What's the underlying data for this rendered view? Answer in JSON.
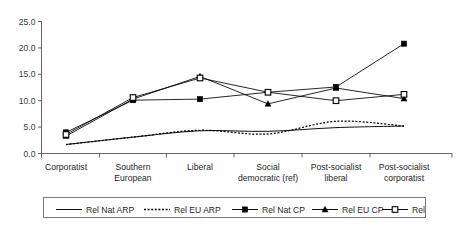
{
  "chart_data": {
    "type": "line",
    "title": "",
    "xlabel": "",
    "ylabel": "",
    "ylim": [
      0,
      25
    ],
    "ytick_values": [
      0,
      5,
      10,
      15,
      20,
      25
    ],
    "ytick_labels": [
      "0.0",
      "5.0",
      "10.0",
      "15.0",
      "20.0",
      "25.0"
    ],
    "grid": false,
    "legend_position": "bottom",
    "categories": [
      "Corporatist",
      "Southern European",
      "Liberal",
      "Social democratic (ref)",
      "Post-socialist liberal",
      "Post-socialist corporatist"
    ],
    "category_label_lines": [
      [
        "Corporatist"
      ],
      [
        "Southern",
        "European"
      ],
      [
        "Liberal"
      ],
      [
        "Social",
        "democratic (ref)"
      ],
      [
        "Post-socialist",
        "liberal"
      ],
      [
        "Post-socialist",
        "corporatist"
      ]
    ],
    "series": [
      {
        "name": "Rel Nat ARP",
        "style": "solid-line",
        "marker": "none",
        "smooth": true,
        "values": [
          1.7,
          3.1,
          4.3,
          4.2,
          4.9,
          5.2
        ]
      },
      {
        "name": "Rel EU ARP",
        "style": "dotted-line",
        "marker": "none",
        "smooth": true,
        "values": [
          1.7,
          3.1,
          4.4,
          3.7,
          6.1,
          5.2
        ]
      },
      {
        "name": "Rel Nat CP",
        "style": "solid-line",
        "marker": "filled-square",
        "smooth": false,
        "values": [
          4.0,
          10.1,
          10.3,
          11.6,
          12.6,
          20.8
        ]
      },
      {
        "name": "Rel EU CP",
        "style": "solid-line",
        "marker": "filled-triangle",
        "smooth": false,
        "values": [
          3.3,
          10.3,
          14.6,
          9.4,
          12.4,
          10.4
        ]
      },
      {
        "name": "Rel Mix CP",
        "style": "solid-line",
        "marker": "open-square",
        "smooth": false,
        "values": [
          3.6,
          10.6,
          14.3,
          11.6,
          10.0,
          11.2
        ]
      }
    ]
  },
  "legend": {
    "entries": [
      {
        "label": "Rel Nat ARP",
        "style": "solid-line",
        "marker": "none"
      },
      {
        "label": "Rel EU ARP",
        "style": "dotted-line",
        "marker": "none"
      },
      {
        "label": "Rel Nat CP",
        "style": "solid-line",
        "marker": "filled-square"
      },
      {
        "label": "Rel EU CP",
        "style": "solid-line",
        "marker": "filled-triangle"
      },
      {
        "label": "Rel Mix CP",
        "style": "solid-line",
        "marker": "open-square"
      }
    ]
  },
  "colors": {
    "line": "#000000",
    "axis": "#555555",
    "text": "#1f1f1f",
    "background": "#ffffff"
  }
}
